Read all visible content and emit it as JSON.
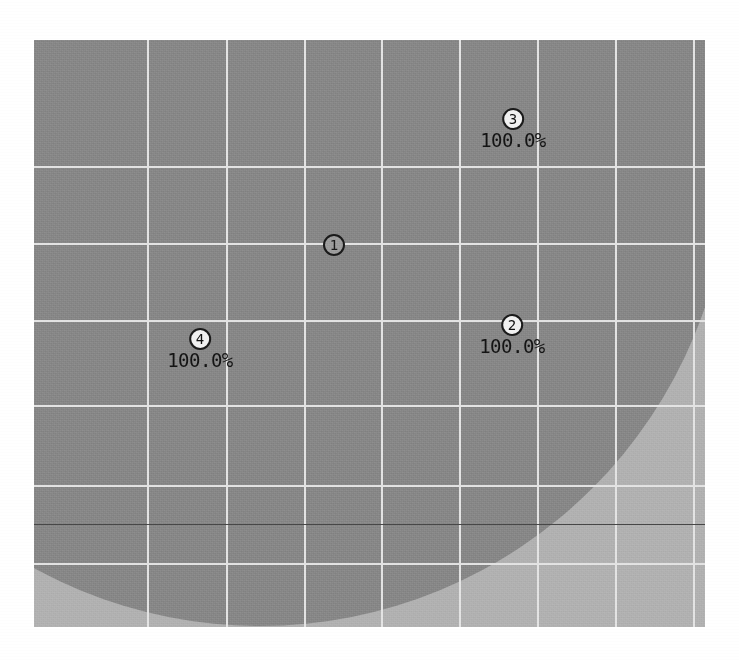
{
  "figure": {
    "type": "coverage-region-plot",
    "background_color": "#ffffff",
    "plot_background_color": "#b2b2b2",
    "region_color": "#888888",
    "gridline_color": "#e4e4e4",
    "threshold_line_color": "#464646",
    "marker_text_color": "#141414"
  },
  "plot": {
    "left": 34,
    "top": 40,
    "width": 671,
    "height": 587
  },
  "grid": {
    "vertical_x": [
      113,
      192,
      270,
      347,
      425,
      503,
      581,
      659
    ],
    "horizontal_y": [
      126,
      203,
      280,
      365,
      445,
      523
    ],
    "threshold_y": 524
  },
  "region": {
    "shape": "circle",
    "center_x": 226,
    "center_y": 116,
    "radius": 470
  },
  "markers": [
    {
      "id": "1",
      "number": "1",
      "label": "",
      "x": 300,
      "y": 205,
      "fill": "gray",
      "has_label": false
    },
    {
      "id": "2",
      "number": "2",
      "label": "100.0%",
      "x": 478,
      "y": 295,
      "fill": "white",
      "has_label": true
    },
    {
      "id": "3",
      "number": "3",
      "label": "100.0%",
      "x": 479,
      "y": 89,
      "fill": "white",
      "has_label": true
    },
    {
      "id": "4",
      "number": "4",
      "label": "100.0%",
      "x": 166,
      "y": 309,
      "fill": "white",
      "has_label": true
    }
  ],
  "chart_data": {
    "type": "scatter",
    "title": "",
    "xlabel": "",
    "ylabel": "",
    "grid": true,
    "legend": null,
    "annotations": [
      {
        "point": "1",
        "value": null,
        "value_text": ""
      },
      {
        "point": "2",
        "value": 100.0,
        "value_text": "100.0%"
      },
      {
        "point": "3",
        "value": 100.0,
        "value_text": "100.0%"
      },
      {
        "point": "4",
        "value": 100.0,
        "value_text": "100.0%"
      }
    ],
    "series": [
      {
        "name": "points",
        "labels": [
          "1",
          "2",
          "3",
          "4"
        ],
        "x": [
          300,
          478,
          479,
          166
        ],
        "y": [
          205,
          295,
          89,
          309
        ],
        "values": [
          null,
          100.0,
          100.0,
          100.0
        ]
      }
    ],
    "shaded_region": {
      "name": "coverage-area",
      "shape": "circle",
      "color": "#888888"
    }
  }
}
